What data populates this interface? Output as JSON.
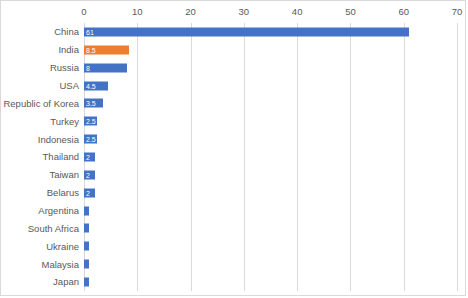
{
  "chart_data": {
    "type": "bar",
    "orientation": "horizontal",
    "title": "",
    "subtitle": "",
    "xlabel": "",
    "ylabel": "",
    "xlim": [
      0,
      70
    ],
    "xticks": [
      0,
      10,
      20,
      30,
      40,
      50,
      60,
      70
    ],
    "grid": true,
    "legend": false,
    "legend_position": "none",
    "categories": [
      "China",
      "India",
      "Russia",
      "USA",
      "Republic of Korea",
      "Turkey",
      "Indonesia",
      "Thailand",
      "Taiwan",
      "Belarus",
      "Argentina",
      "South Africa",
      "Ukraine",
      "Malaysia",
      "Japan"
    ],
    "values": [
      61,
      8.5,
      8,
      4.5,
      3.5,
      2.5,
      2.5,
      2,
      2,
      2,
      1,
      1,
      1,
      1,
      1
    ],
    "data_labels": [
      "61",
      "8.5",
      "8",
      "4.5",
      "3.5",
      "2.5",
      "2.5",
      "2",
      "2",
      "2",
      "",
      "",
      "",
      "",
      ""
    ],
    "highlight_index": 1,
    "colors": {
      "bar": "#4472C4",
      "highlight": "#ED7D31",
      "gridline": "#D9D9D9",
      "text": "#595959",
      "label_text": "#FFFFFF",
      "background": "#FFFFFF",
      "border": "#D9D9D9"
    }
  }
}
